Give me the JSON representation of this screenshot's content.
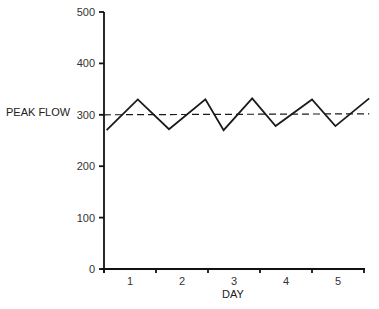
{
  "chart_data": {
    "type": "line",
    "title": "",
    "xlabel": "DAY",
    "ylabel": "PEAK FLOW",
    "ylim": [
      0,
      500
    ],
    "yticks": [
      0,
      100,
      200,
      300,
      400,
      500
    ],
    "xtick_labels": [
      "1",
      "2",
      "3",
      "4",
      "5"
    ],
    "xlim": [
      0,
      5
    ],
    "grid": false,
    "legend": null,
    "series": [
      {
        "name": "peak flow",
        "style": "solid",
        "x": [
          0.05,
          0.65,
          1.25,
          1.95,
          2.3,
          2.85,
          3.3,
          4.0,
          4.45,
          5.1
        ],
        "values": [
          270,
          330,
          272,
          330,
          270,
          332,
          278,
          330,
          278,
          332
        ]
      },
      {
        "name": "reference",
        "style": "dashed",
        "x": [
          0,
          5.1
        ],
        "values": [
          300,
          302
        ]
      }
    ]
  },
  "axes": {
    "y_title": "PEAK FLOW",
    "x_title": "DAY"
  }
}
